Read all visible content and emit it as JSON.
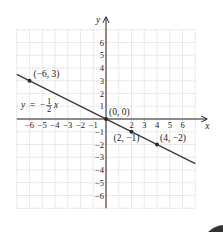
{
  "chart_data": {
    "type": "line",
    "title": "",
    "xlabel": "x",
    "ylabel": "y",
    "xlim": [
      -7,
      7
    ],
    "ylim": [
      -7,
      7
    ],
    "grid": true,
    "x_ticks": [
      "−6",
      "−5",
      "−4",
      "−3",
      "−2",
      "−1",
      "2",
      "3",
      "4",
      "5",
      "6"
    ],
    "y_ticks": [
      "6",
      "5",
      "4",
      "3",
      "2",
      "1",
      "−1",
      "−2",
      "−3",
      "−4",
      "−5",
      "−6"
    ],
    "series": [
      {
        "name": "y = −½x",
        "equation": "y = -1/2 x",
        "x": [
          -7,
          7
        ],
        "y": [
          3.5,
          -3.5
        ]
      }
    ],
    "points": [
      {
        "x": -6,
        "y": 3,
        "label": "(−6, 3)"
      },
      {
        "x": 0,
        "y": 0,
        "label": "(0, 0)"
      },
      {
        "x": 2,
        "y": -1,
        "label": "(2, −1)"
      },
      {
        "x": 4,
        "y": -2,
        "label": "(4, −2)"
      }
    ],
    "equation_label": {
      "lhs": "y",
      "eq": "=",
      "minus": "−",
      "num": "1",
      "den": "2",
      "var": "x"
    }
  },
  "axis_labels": {
    "x": "x",
    "y": "y"
  },
  "colors": {
    "line": "#3a3a3a",
    "grid": "#bdbdbd",
    "axis": "#222222",
    "point": "#2b2b2b"
  }
}
